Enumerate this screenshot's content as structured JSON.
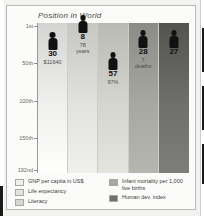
{
  "chart": {
    "title": "Position in World",
    "y_axis": {
      "labels": [
        "1st",
        "50th",
        "100th",
        "150th",
        "192nd"
      ]
    }
  },
  "legend": {
    "left": [
      {
        "label": "GNP per capita in US$",
        "color": "#f0f0ee"
      },
      {
        "label": "Life expectancy",
        "color": "#e2e2de"
      },
      {
        "label": "Literacy",
        "color": "#d6d6d1"
      }
    ],
    "right": [
      {
        "label": "Infant mortality per 1,000 live births",
        "color": "#a8a8a3"
      },
      {
        "label": "Human dev. index",
        "color": "#6f6f6b"
      }
    ]
  },
  "chart_data": {
    "type": "bar",
    "title": "Position in World",
    "xlabel": "",
    "ylabel": "Position in World",
    "ylim": [
      1,
      192
    ],
    "y_inverted": true,
    "grid": true,
    "legend_position": "bottom",
    "ytick_labels": [
      "1st",
      "50th",
      "100th",
      "150th",
      "192nd"
    ],
    "ytick_values": [
      1,
      50,
      100,
      150,
      192
    ],
    "categories": [
      "GNP per capita in US$",
      "Life expectancy",
      "Literacy",
      "Infant mortality per 1,000 live births",
      "Human dev. index"
    ],
    "values": [
      30,
      8,
      57,
      28,
      27
    ],
    "point_labels": [
      {
        "rank": "30",
        "value": "$11640",
        "unit": ""
      },
      {
        "rank": "8",
        "value": "78",
        "unit": "years"
      },
      {
        "rank": "57",
        "value": "97%",
        "unit": ""
      },
      {
        "rank": "28",
        "value": "7",
        "unit": "deaths"
      },
      {
        "rank": "27",
        "value": "",
        "unit": ""
      }
    ],
    "column_colors": [
      "#f0f0ee",
      "#e2e2de",
      "#d6d6d1",
      "#a8a8a3",
      "#6f6f6b"
    ]
  }
}
